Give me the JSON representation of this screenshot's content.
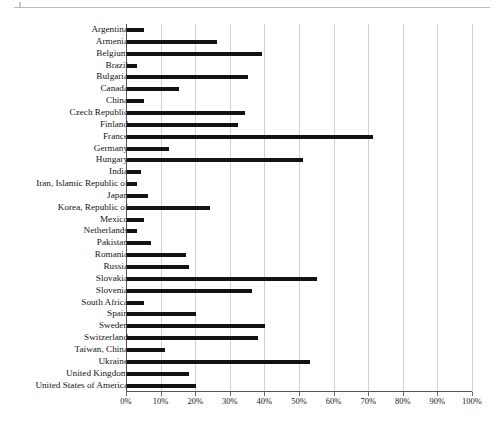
{
  "figure": {
    "has_top_rule": true,
    "background_color": "#ffffff",
    "bar_color": "#131313",
    "gridline_color": "#d2d2d2",
    "axis_color": "#4a4a4a"
  },
  "chart_data": {
    "type": "bar",
    "orientation": "horizontal",
    "title": "",
    "subtitle": "",
    "xlabel": "",
    "ylabel": "",
    "xlim": [
      0,
      100
    ],
    "grid": true,
    "legend": null,
    "value_unit": "%",
    "xticks": [
      "0%",
      "10%",
      "20%",
      "30%",
      "40%",
      "50%",
      "60%",
      "70%",
      "80%",
      "90%",
      "100%"
    ],
    "xtick_values": [
      0,
      10,
      20,
      30,
      40,
      50,
      60,
      70,
      80,
      90,
      100
    ],
    "categories": [
      "Argentina",
      "Armenia",
      "Belgium",
      "Brazil",
      "Bulgaria",
      "Canada",
      "China",
      "Czech Republic",
      "Finland",
      "France",
      "Germany",
      "Hungary",
      "India",
      "Iran, Islamic Republic of",
      "Japan",
      "Korea, Republic of",
      "Mexico",
      "Netherlands",
      "Pakistan",
      "Romania",
      "Russia",
      "Slovakia",
      "Slovenia",
      "South Africa",
      "Spain",
      "Sweden",
      "Switzerland",
      "Taiwan, China",
      "Ukraine",
      "United Kingdom",
      "United States of America"
    ],
    "values": [
      5,
      26,
      39,
      3,
      35,
      15,
      5,
      34,
      32,
      71,
      12,
      51,
      4,
      3,
      6,
      24,
      5,
      3,
      7,
      17,
      18,
      55,
      36,
      5,
      20,
      40,
      38,
      11,
      53,
      18,
      20
    ]
  }
}
